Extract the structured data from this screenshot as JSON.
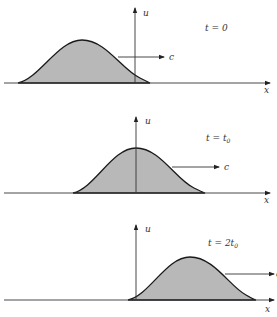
{
  "figure": {
    "colors": {
      "fill": "#b8b8b8",
      "stroke": "#1a1a1a",
      "axis": "#333333"
    },
    "panels": [
      {
        "time_label": "t = 0",
        "time_main": "t = 0",
        "time_sub": "",
        "u_label": "u",
        "x_label": "x",
        "c_label": "c"
      },
      {
        "time_label": "t = t0",
        "time_main": "t = t",
        "time_sub": "0",
        "u_label": "u",
        "x_label": "x",
        "c_label": "c"
      },
      {
        "time_label": "t = 2t0",
        "time_main": "t = 2t",
        "time_sub": "0",
        "u_label": "u",
        "x_label": "x",
        "c_label": "c"
      }
    ]
  }
}
